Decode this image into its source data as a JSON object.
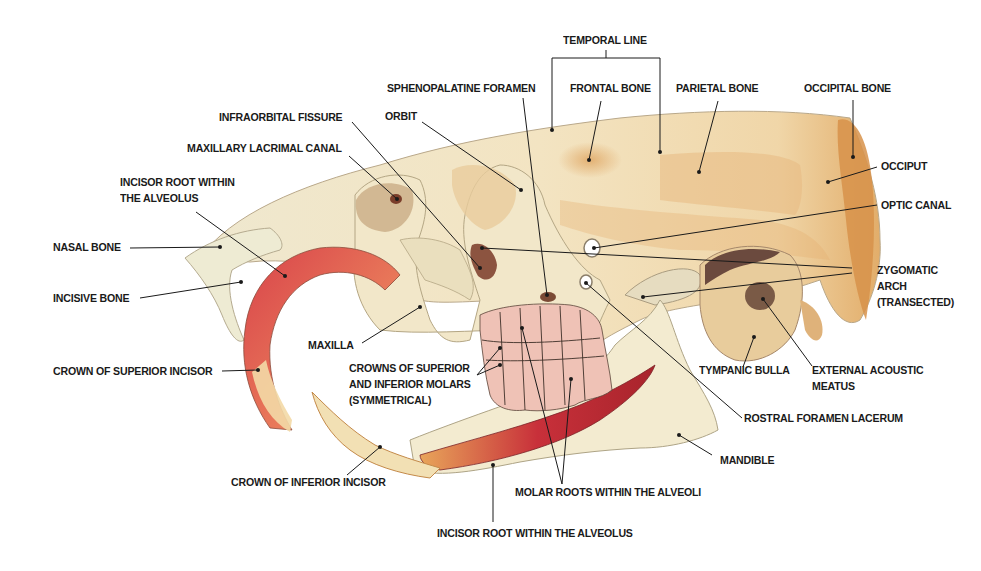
{
  "diagram": {
    "colors": {
      "bone": "#f1e6c6",
      "bone_shadow": "#d9b98a",
      "bone_orange": "#d89a55",
      "incisor_red": "#c8303a",
      "incisor_orange": "#e69a4a",
      "molar_pink": "#efb9b0",
      "leader_line": "#1a1a1a",
      "text": "#1a1a1a"
    },
    "labels": {
      "temporal_line": "TEMPORAL LINE",
      "sphenopalatine_foramen": "SPHENOPALATINE FORAMEN",
      "frontal_bone": "FRONTAL BONE",
      "parietal_bone": "PARIETAL BONE",
      "occipital_bone": "OCCIPITAL BONE",
      "infraorbital_fissure": "INFRAORBITAL FISSURE",
      "orbit": "ORBIT",
      "maxillary_lacrimal_canal": "MAXILLARY LACRIMAL CANAL",
      "occiput": "OCCIPUT",
      "incisor_root_upper": "INCISOR ROOT WITHIN\nTHE ALVEOLUS",
      "optic_canal": "OPTIC CANAL",
      "nasal_bone": "NASAL BONE",
      "zygomatic_arch": "ZYGOMATIC\nARCH\n(TRANSECTED)",
      "incisive_bone": "INCISIVE BONE",
      "maxilla": "MAXILLA",
      "crowns_molars": "CROWNS OF SUPERIOR\nAND INFERIOR MOLARS\n(SYMMETRICAL)",
      "crown_superior_incisor": "CROWN OF SUPERIOR INCISOR",
      "tympanic_bulla": "TYMPANIC BULLA",
      "external_acoustic_meatus": "EXTERNAL ACOUSTIC\nMEATUS",
      "rostral_foramen_lacerum": "ROSTRAL FORAMEN LACERUM",
      "mandible": "MANDIBLE",
      "crown_inferior_incisor": "CROWN OF INFERIOR INCISOR",
      "molar_roots": "MOLAR ROOTS WITHIN THE ALVEOLI",
      "incisor_root_lower": "INCISOR ROOT WITHIN THE ALVEOLUS"
    }
  }
}
